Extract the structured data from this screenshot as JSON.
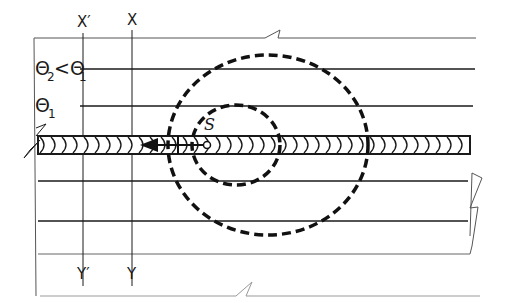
{
  "diagram": {
    "type": "weld-temperature-field",
    "labels": {
      "x_prime": "X′",
      "x": "X",
      "y_prime": "Y′",
      "y": "Y",
      "theta_compare": "Θ2<Θ1",
      "theta_compare_main": "Θ",
      "theta_compare_sub1": "2",
      "theta_compare_op": "<Θ",
      "theta_compare_sub2": "1",
      "theta1_main": "Θ",
      "theta1_sub": "1",
      "source": "S"
    },
    "elements": {
      "plate": "plate with break lines (zigzag)",
      "weld_bead": "horizontal weld bead with chevron ripples",
      "heat_source": "point S with arrow showing travel direction (left)",
      "isotherm_inner": "dashed ellipse around S (temperature Θ1)",
      "isotherm_outer": "dashed ellipse (temperature Θ2 < Θ1)",
      "section_lines": [
        "X′–Y′",
        "X–Y"
      ],
      "horizontal_lines_count": 6
    },
    "colors": {
      "line": "#1a1a1a",
      "background": "#ffffff"
    }
  }
}
